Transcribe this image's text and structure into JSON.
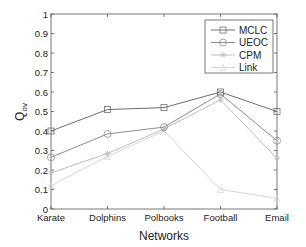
{
  "chart_data": {
    "type": "line",
    "title": "",
    "xlabel": "Networks",
    "ylabel": "Q",
    "ylabel_subscript": "ov",
    "categories": [
      "Karate",
      "Dolphins",
      "Polbooks",
      "Football",
      "Email"
    ],
    "ylim": [
      0,
      1
    ],
    "yticks": [
      0,
      0.1,
      0.2,
      0.3,
      0.4,
      0.5,
      0.6,
      0.7,
      0.8,
      0.9,
      1
    ],
    "ytick_labels": [
      "0",
      "0.1",
      "0.2",
      "0.3",
      "0.4",
      "0.5",
      "0.6",
      "0.7",
      "0.8",
      "0.9",
      "1"
    ],
    "grid": false,
    "legend_position": "upper right",
    "series": [
      {
        "name": "MCLC",
        "marker": "square",
        "color": "#6e6e6e",
        "values": [
          0.4,
          0.51,
          0.52,
          0.6,
          0.5
        ]
      },
      {
        "name": "UEOC",
        "marker": "circle",
        "color": "#8c8c8c",
        "values": [
          0.265,
          0.385,
          0.42,
          0.59,
          0.35
        ]
      },
      {
        "name": "CPM",
        "marker": "star",
        "color": "#bdbdbd",
        "values": [
          0.185,
          0.285,
          0.41,
          0.56,
          0.26
        ]
      },
      {
        "name": "Link",
        "marker": "triangle",
        "color": "#d6d6d6",
        "values": [
          0.12,
          0.27,
          0.4,
          0.1,
          0.055
        ]
      }
    ]
  }
}
